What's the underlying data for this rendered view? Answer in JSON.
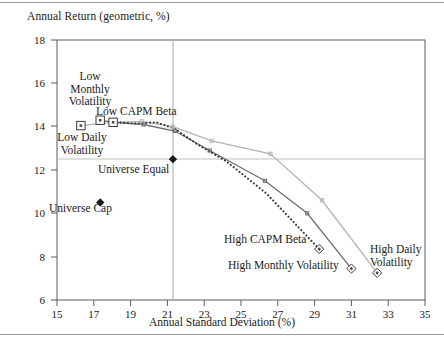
{
  "figure": {
    "title_y": "Annual Return (geometric, %)",
    "title_x": "Annual Standard Deviation (%)"
  },
  "axes": {
    "x_ticks": [
      "15",
      "17",
      "19",
      "21",
      "23",
      "25",
      "27",
      "29",
      "31",
      "33",
      "35"
    ],
    "y_ticks": [
      "6",
      "8",
      "10",
      "12",
      "14",
      "16",
      "18"
    ]
  },
  "labels": {
    "low_monthly_volatility": "Low\nMonthly\nVolatility",
    "low_monthly_volatility_l1": "Low",
    "low_monthly_volatility_l2": "Monthly",
    "low_monthly_volatility_l3": "Volatility",
    "low_capm_beta": "Low CAPM Beta",
    "low_daily_volatility_l1": "Low Daily",
    "low_daily_volatility_l2": "Volatility",
    "universe_equal": "Universe Equal",
    "universe_cap": "Universe Cap",
    "high_capm_beta": "High CAPM Beta",
    "high_monthly_volatility": "High Monthly Volatility",
    "high_daily_volatility_l1": "High Daily",
    "high_daily_volatility_l2": "Volatility"
  },
  "chart_data": {
    "type": "scatter",
    "title": "",
    "xlabel": "Annual Standard Deviation (%)",
    "ylabel": "Annual Return (geometric, %)",
    "xlim": [
      15,
      35
    ],
    "ylim": [
      6,
      18
    ],
    "xticks": [
      15,
      17,
      19,
      21,
      23,
      25,
      27,
      29,
      31,
      33,
      35
    ],
    "yticks": [
      6,
      8,
      10,
      12,
      14,
      16,
      18
    ],
    "grid": "reference lines at x=21.3 and y=12.5 (Universe Equal)",
    "reference_lines": {
      "vertical_x": 21.3,
      "horizontal_y": 12.5
    },
    "legend": "none (direct point annotations)",
    "series": [
      {
        "name": "Daily Volatility",
        "style": "solid-light-gray",
        "color": "#b4b4b4",
        "marker": "open-square-to-open-diamond",
        "x": [
          16.3,
          18.0,
          19.6,
          21.3,
          23.4,
          26.6,
          29.4,
          32.4
        ],
        "y": [
          14.05,
          14.2,
          14.25,
          14.0,
          13.35,
          12.75,
          10.6,
          7.25
        ]
      },
      {
        "name": "Monthly Volatility",
        "style": "solid-dark-gray",
        "color": "#6e6e6e",
        "marker": "open-square-to-open-diamond",
        "x": [
          17.35,
          18.05,
          19.7,
          21.4,
          23.3,
          26.3,
          28.6,
          31.0
        ],
        "y": [
          14.3,
          14.2,
          14.1,
          13.8,
          12.9,
          11.5,
          10.0,
          7.45
        ]
      },
      {
        "name": "CAPM Beta",
        "style": "dotted-dark",
        "color": "#3a3a3a",
        "marker": "open-square-to-open-diamond",
        "x": [
          18.05,
          19.3,
          20.4,
          21.4,
          22.6,
          24.2,
          26.4,
          29.25
        ],
        "y": [
          14.2,
          14.15,
          14.2,
          13.9,
          13.2,
          12.4,
          10.9,
          8.35
        ]
      }
    ],
    "points": [
      {
        "name": "Universe Equal",
        "x": 21.3,
        "y": 12.5,
        "marker": "filled-diamond"
      },
      {
        "name": "Universe Cap",
        "x": 17.35,
        "y": 10.5,
        "marker": "filled-diamond"
      }
    ],
    "annotations": [
      {
        "text": "Low Monthly Volatility",
        "target": "Monthly Volatility first point"
      },
      {
        "text": "Low Daily Volatility",
        "target": "Daily Volatility first point"
      },
      {
        "text": "Low CAPM Beta",
        "target": "CAPM Beta first point"
      },
      {
        "text": "High CAPM Beta",
        "target": "CAPM Beta last point"
      },
      {
        "text": "High Monthly Volatility",
        "target": "Monthly Volatility last point"
      },
      {
        "text": "High Daily Volatility",
        "target": "Daily Volatility last point"
      },
      {
        "text": "Universe Equal",
        "target": "Universe Equal point"
      },
      {
        "text": "Universe Cap",
        "target": "Universe Cap point"
      }
    ]
  }
}
